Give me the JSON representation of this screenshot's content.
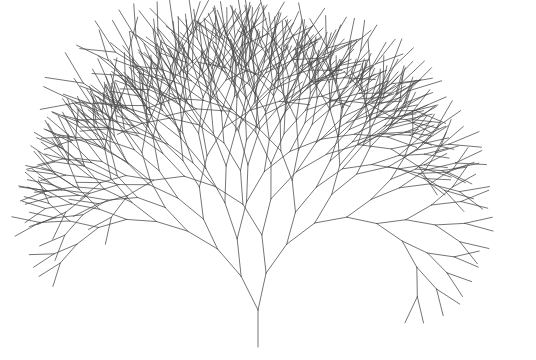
{
  "image": {
    "description": "Recursive fractal tree drawn with thin gray lines on a white background",
    "width": 536,
    "height": 360,
    "background": "#ffffff"
  },
  "tree": {
    "stroke_color": "#4a4a4a",
    "stroke_width": 0.9,
    "stroke_opacity": 0.85,
    "trunk_base": {
      "x": 258,
      "y": 347
    },
    "trunk_length": 37,
    "trunk_angle_deg": 0,
    "depth": 10,
    "length_scale": 0.965,
    "length_jitter": 0.12,
    "left_angle_deg": -19,
    "right_angle_deg": 19,
    "angle_jitter_deg": 9,
    "bias_deg": 1.2,
    "seed": 7
  }
}
